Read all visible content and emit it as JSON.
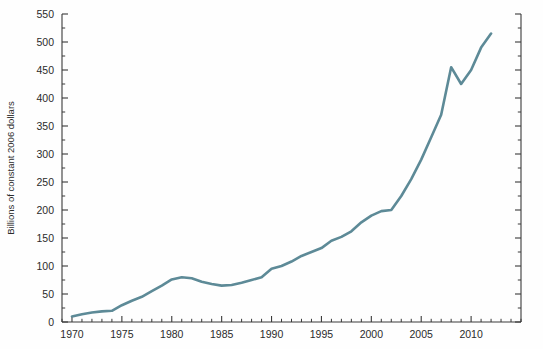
{
  "chart_data": {
    "type": "line",
    "title": "",
    "subtitle": "",
    "xlabel": "",
    "ylabel": "Billions of constant 2006 dollars",
    "xlim": [
      1969,
      2015
    ],
    "ylim": [
      0,
      550
    ],
    "grid": false,
    "legend": null,
    "legend_position": "none",
    "line_color": "#5d8a97",
    "line_width": 2.6,
    "x_major_ticks": [
      1970,
      1975,
      1980,
      1985,
      1990,
      1995,
      2000,
      2005,
      2010
    ],
    "x_major_tick_labels": [
      "1970",
      "1975",
      "1980",
      "1985",
      "1990",
      "1995",
      "2000",
      "2005",
      "2010"
    ],
    "x_minor_tick_interval": 1,
    "y_major_ticks": [
      0,
      50,
      100,
      150,
      200,
      250,
      300,
      350,
      400,
      450,
      500,
      550
    ],
    "y_major_tick_labels": [
      "0",
      "50",
      "100",
      "150",
      "200",
      "250",
      "300",
      "350",
      "400",
      "450",
      "500",
      "550"
    ],
    "y_minor_tick_interval": 25,
    "axes_visible": [
      "left",
      "bottom",
      "right"
    ],
    "x": [
      1970,
      1971,
      1972,
      1973,
      1974,
      1975,
      1976,
      1977,
      1978,
      1979,
      1980,
      1981,
      1982,
      1983,
      1984,
      1985,
      1986,
      1987,
      1988,
      1989,
      1990,
      1991,
      1992,
      1993,
      1994,
      1995,
      1996,
      1997,
      1998,
      1999,
      2000,
      2001,
      2002,
      2003,
      2004,
      2005,
      2006,
      2007,
      2008,
      2009,
      2010,
      2011,
      2012
    ],
    "values": [
      10,
      14,
      17,
      19,
      20,
      30,
      38,
      45,
      55,
      65,
      76,
      80,
      78,
      72,
      68,
      65,
      66,
      70,
      75,
      80,
      95,
      100,
      108,
      118,
      125,
      132,
      145,
      152,
      162,
      178,
      190,
      198,
      200,
      225,
      255,
      290,
      330,
      370,
      455,
      425,
      450,
      490,
      515
    ],
    "series": [
      {
        "name": "Spending",
        "color": "#5d8a97",
        "values": [
          10,
          14,
          17,
          19,
          20,
          30,
          38,
          45,
          55,
          65,
          76,
          80,
          78,
          72,
          68,
          65,
          66,
          70,
          75,
          80,
          95,
          100,
          108,
          118,
          125,
          132,
          145,
          152,
          162,
          178,
          190,
          198,
          200,
          225,
          255,
          290,
          330,
          370,
          455,
          425,
          450,
          490,
          515
        ]
      }
    ],
    "annotations": []
  },
  "axis": {
    "y_title": "Billions of constant 2006 dollars"
  }
}
